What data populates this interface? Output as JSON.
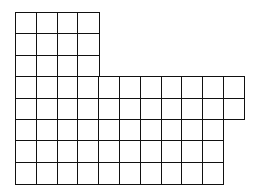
{
  "diagram": {
    "type": "grid-shape",
    "origin": {
      "x": 15,
      "y": 12
    },
    "cell_size": {
      "w": 20.8,
      "h": 21.4
    },
    "line_color": "#111111",
    "background": "#ffffff",
    "rows": [
      {
        "row": 1,
        "columns": 4
      },
      {
        "row": 2,
        "columns": 4
      },
      {
        "row": 3,
        "columns": 4
      },
      {
        "row": 4,
        "columns": 11
      },
      {
        "row": 5,
        "columns": 11
      },
      {
        "row": 6,
        "columns": 10
      },
      {
        "row": 7,
        "columns": 10
      },
      {
        "row": 8,
        "columns": 10
      }
    ],
    "total_cells": 62
  }
}
